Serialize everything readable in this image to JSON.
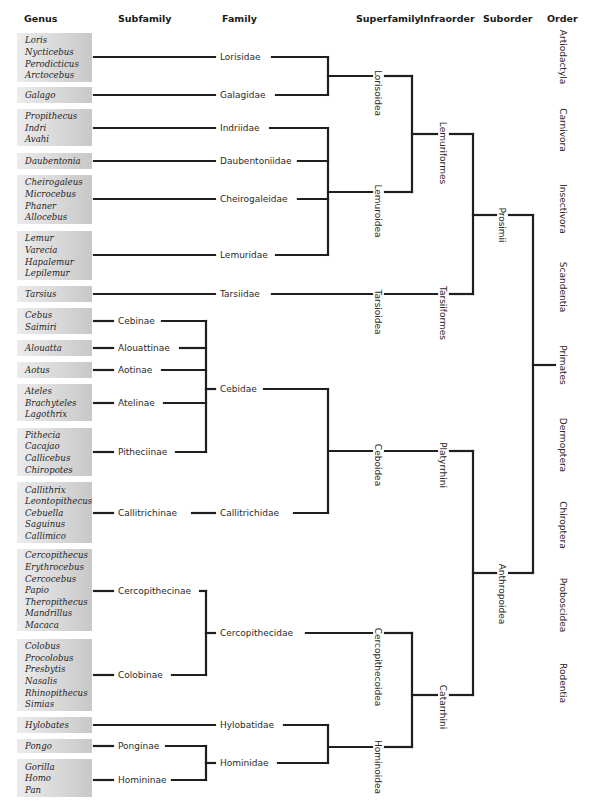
{
  "headers": [
    {
      "id": "genus",
      "label": "Genus",
      "x": 24
    },
    {
      "id": "subfamily",
      "label": "Subfamily",
      "x": 118
    },
    {
      "id": "family",
      "label": "Family",
      "x": 222
    },
    {
      "id": "superfamily",
      "label": "Superfamily",
      "x": 356
    },
    {
      "id": "infraorder",
      "label": "Infraorder",
      "x": 420
    },
    {
      "id": "suborder",
      "label": "Suborder",
      "x": 483
    },
    {
      "id": "order",
      "label": "Order",
      "x": 547
    }
  ],
  "colors": {
    "line": "#1f1f1f",
    "genus_box_light": "#e9e9e9",
    "genus_box_dark": "#c9c9c9",
    "text": "#2a2a2a"
  },
  "genus_groups": [
    {
      "y0": 33,
      "y1": 82,
      "lineY": 57,
      "genera": [
        "Loris",
        "Nycticebus",
        "Perodicticus",
        "Arctocebus"
      ]
    },
    {
      "y0": 87,
      "y1": 103,
      "lineY": 95,
      "genera": [
        "Galago"
      ]
    },
    {
      "y0": 109,
      "y1": 146,
      "lineY": 128,
      "genera": [
        "Propithecus",
        "Indri",
        "Avahi"
      ]
    },
    {
      "y0": 153,
      "y1": 169,
      "lineY": 161,
      "genera": [
        "Daubentonia"
      ]
    },
    {
      "y0": 175,
      "y1": 224,
      "lineY": 199,
      "genera": [
        "Cheirogaleus",
        "Microcebus",
        "Phaner",
        "Allocebus"
      ]
    },
    {
      "y0": 231,
      "y1": 280,
      "lineY": 255,
      "genera": [
        "Lemur",
        "Varecia",
        "Hapalemur",
        "Lepilemur"
      ]
    },
    {
      "y0": 286,
      "y1": 302,
      "lineY": 294,
      "genera": [
        "Tarsius"
      ]
    },
    {
      "y0": 308,
      "y1": 334,
      "lineY": 321,
      "genera": [
        "Cebus",
        "Saimiri"
      ]
    },
    {
      "y0": 340,
      "y1": 356,
      "lineY": 348,
      "genera": [
        "Alouatta"
      ]
    },
    {
      "y0": 362,
      "y1": 378,
      "lineY": 370,
      "genera": [
        "Aotus"
      ]
    },
    {
      "y0": 384,
      "y1": 421,
      "lineY": 403,
      "genera": [
        "Ateles",
        "Brachyteles",
        "Lagothrix"
      ]
    },
    {
      "y0": 428,
      "y1": 476,
      "lineY": 452,
      "genera": [
        "Pithecia",
        "Cacajao",
        "Callicebus",
        "Chiropotes"
      ]
    },
    {
      "y0": 482,
      "y1": 543,
      "lineY": 513,
      "genera": [
        "Callithrix",
        "Leontopithecus",
        "Cebuella",
        "Saguinus",
        "Callimico"
      ]
    },
    {
      "y0": 549,
      "y1": 631,
      "lineY": 591,
      "genera": [
        "Cercopithecus",
        "Erythrocebus",
        "Cercocebus",
        "Papio",
        "Theropithecus",
        "Mandrillus",
        "Macaca"
      ]
    },
    {
      "y0": 639,
      "y1": 711,
      "lineY": 675,
      "genera": [
        "Colobus",
        "Procolobus",
        "Presbytis",
        "Nasalis",
        "Rhinopithecus",
        "Simias"
      ]
    },
    {
      "y0": 717,
      "y1": 733,
      "lineY": 725,
      "genera": [
        "Hylobates"
      ]
    },
    {
      "y0": 739,
      "y1": 753,
      "lineY": 746,
      "genera": [
        "Pongo"
      ]
    },
    {
      "y0": 759,
      "y1": 797,
      "lineY": 780,
      "genera": [
        "Gorilla",
        "Homo",
        "Pan"
      ]
    }
  ],
  "subfamilies": [
    {
      "label": "Cebinae",
      "y": 321
    },
    {
      "label": "Alouattinae",
      "y": 348
    },
    {
      "label": "Aotinae",
      "y": 370
    },
    {
      "label": "Atelinae",
      "y": 403
    },
    {
      "label": "Pitheciinae",
      "y": 452
    },
    {
      "label": "Callitrichinae",
      "y": 513
    },
    {
      "label": "Cercopithecinae",
      "y": 591
    },
    {
      "label": "Colobinae",
      "y": 675
    },
    {
      "label": "Ponginae",
      "y": 746
    },
    {
      "label": "Homininae",
      "y": 780
    }
  ],
  "families": [
    {
      "label": "Lorisidae",
      "y": 57
    },
    {
      "label": "Galagidae",
      "y": 95
    },
    {
      "label": "Indriidae",
      "y": 128
    },
    {
      "label": "Daubentoniidae",
      "y": 161
    },
    {
      "label": "Cheirogaleidae",
      "y": 199
    },
    {
      "label": "Lemuridae",
      "y": 255
    },
    {
      "label": "Tarsiidae",
      "y": 294
    },
    {
      "label": "Cebidae",
      "y": 389
    },
    {
      "label": "Callitrichidae",
      "y": 513
    },
    {
      "label": "Cercopithecidae",
      "y": 633
    },
    {
      "label": "Hylobatidae",
      "y": 725
    },
    {
      "label": "Hominidae",
      "y": 763
    }
  ],
  "superfamilies": [
    {
      "label": "Lorisoidea",
      "y": 76
    },
    {
      "label": "Lemuroidea",
      "y": 192
    },
    {
      "label": "Tarsioidea",
      "y": 294
    },
    {
      "label": "Ceboidea",
      "y": 451
    },
    {
      "label": "Cercopithecoidea",
      "y": 633
    },
    {
      "label": "Hominoidea",
      "y": 747
    }
  ],
  "infraorders": [
    {
      "label": "Lemuriformes",
      "y": 134
    },
    {
      "label": "Tarsiiformes",
      "y": 294
    },
    {
      "label": "Platyrrhini",
      "y": 451
    },
    {
      "label": "Catarrhini",
      "y": 695
    }
  ],
  "suborders": [
    {
      "label": "Prosimii",
      "y": 215
    },
    {
      "label": "Anthropoidea",
      "y": 573
    }
  ],
  "orders": [
    {
      "label": "Artiodactyla",
      "y": 57
    },
    {
      "label": "Carnivora",
      "y": 130
    },
    {
      "label": "Insectivora",
      "y": 209
    },
    {
      "label": "Scandentia",
      "y": 287
    },
    {
      "label": "Primates",
      "y": 365
    },
    {
      "label": "Dermoptera",
      "y": 445
    },
    {
      "label": "Chiroptera",
      "y": 525
    },
    {
      "label": "Proboscidea",
      "y": 605
    },
    {
      "label": "Rodentia",
      "y": 683
    }
  ]
}
